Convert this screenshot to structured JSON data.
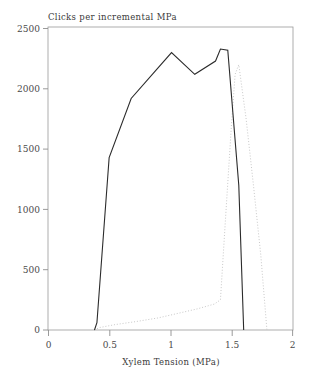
{
  "chart_data": {
    "type": "line",
    "title": "Clicks per incremental MPa",
    "xlabel": "Xylem Tension (MPa)",
    "ylabel": "",
    "xlim": [
      0,
      2
    ],
    "ylim": [
      0,
      2500
    ],
    "xticks": [
      0,
      0.5,
      1,
      1.5,
      2
    ],
    "xtick_labels": [
      "0",
      "0.5",
      "1",
      "1.5",
      "2"
    ],
    "yticks": [
      0,
      500,
      1000,
      1500,
      2000,
      2500
    ],
    "ytick_labels": [
      "0",
      "500",
      "1000",
      "1500",
      "2000",
      "2500"
    ],
    "grid": false,
    "legend": "none",
    "series": [
      {
        "name": "solid-curve",
        "style": "solid",
        "color": "#2b2b2b",
        "x": [
          0.38,
          0.4,
          0.5,
          0.68,
          0.88,
          1.01,
          1.2,
          1.37,
          1.41,
          1.47,
          1.56,
          1.6
        ],
        "y": [
          0,
          60,
          1430,
          1920,
          2150,
          2300,
          2120,
          2230,
          2330,
          2320,
          1200,
          0
        ]
      },
      {
        "name": "dotted-curve",
        "style": "dotted",
        "color": "#c9c9c9",
        "x": [
          0.38,
          0.42,
          0.55,
          0.72,
          0.9,
          1.05,
          1.22,
          1.36,
          1.41,
          1.45,
          1.5,
          1.53,
          1.56,
          1.62,
          1.68,
          1.74,
          1.79
        ],
        "y": [
          0,
          20,
          45,
          70,
          100,
          135,
          175,
          215,
          250,
          900,
          1700,
          2120,
          2200,
          1750,
          1200,
          620,
          0
        ]
      }
    ]
  }
}
